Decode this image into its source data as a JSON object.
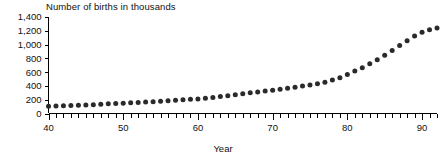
{
  "chart_data": {
    "type": "scatter",
    "title": "Number of births in thousands",
    "xlabel": "Year",
    "ylabel": "",
    "xlim": [
      40,
      92
    ],
    "ylim": [
      0,
      1400
    ],
    "grid": false,
    "legend": "none",
    "marker": "filled-circle",
    "y_ticks": [
      0,
      200,
      400,
      600,
      800,
      1000,
      1200,
      1400
    ],
    "y_tick_labels": [
      "0",
      "200",
      "400",
      "600",
      "800",
      "1,000",
      "1,200",
      "1,400"
    ],
    "x_ticks": [
      40,
      50,
      60,
      70,
      80,
      90
    ],
    "x_tick_labels": [
      "40",
      "50",
      "60",
      "70",
      "80",
      "90"
    ],
    "x_minor_tick_step": 1,
    "x": [
      40,
      41,
      42,
      43,
      44,
      45,
      46,
      47,
      48,
      49,
      50,
      51,
      52,
      53,
      54,
      55,
      56,
      57,
      58,
      59,
      60,
      61,
      62,
      63,
      64,
      65,
      66,
      67,
      68,
      69,
      70,
      71,
      72,
      73,
      74,
      75,
      76,
      77,
      78,
      79,
      80,
      81,
      82,
      83,
      84,
      85,
      86,
      87,
      88,
      89,
      90,
      91,
      92
    ],
    "values": [
      105,
      108,
      112,
      115,
      118,
      122,
      128,
      135,
      140,
      145,
      150,
      155,
      160,
      166,
      172,
      178,
      185,
      192,
      198,
      205,
      212,
      222,
      232,
      245,
      258,
      272,
      288,
      300,
      312,
      325,
      338,
      352,
      368,
      382,
      398,
      415,
      432,
      455,
      485,
      520,
      565,
      615,
      665,
      720,
      780,
      845,
      915,
      985,
      1055,
      1125,
      1180,
      1215,
      1240
    ],
    "series_name": "births"
  },
  "axis_labels": {
    "y": [
      "1,400",
      "1,200",
      "1,000",
      "800",
      "600",
      "400",
      "200",
      "0"
    ],
    "x": [
      "40",
      "50",
      "60",
      "70",
      "80",
      "90"
    ]
  },
  "colors": {
    "marker": "#2a2a2a",
    "axis": "#000000",
    "background": "#ffffff",
    "text": "#111111"
  }
}
